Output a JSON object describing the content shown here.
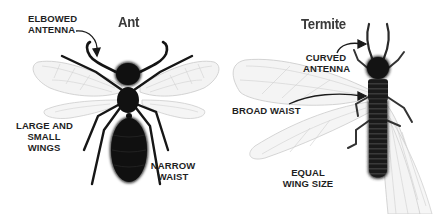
{
  "ant": {
    "title": "Ant",
    "labels": {
      "antenna_line1": "ELBOWED",
      "antenna_line2": "ANTENNA",
      "wings_line1": "LARGE AND",
      "wings_line2": "SMALL",
      "wings_line3": "WINGS",
      "waist_line1": "NARROW",
      "waist_line2": "WAIST"
    }
  },
  "termite": {
    "title": "Termite",
    "labels": {
      "antenna_line1": "CURVED",
      "antenna_line2": "ANTENNA",
      "waist": "BROAD WAIST",
      "wings_line1": "EQUAL",
      "wings_line2": "WING SIZE"
    }
  },
  "colors": {
    "body": "#111111",
    "wing_fill": "#f4f4f4",
    "wing_vein": "#c8c8c8",
    "text": "#1f1f1f"
  }
}
